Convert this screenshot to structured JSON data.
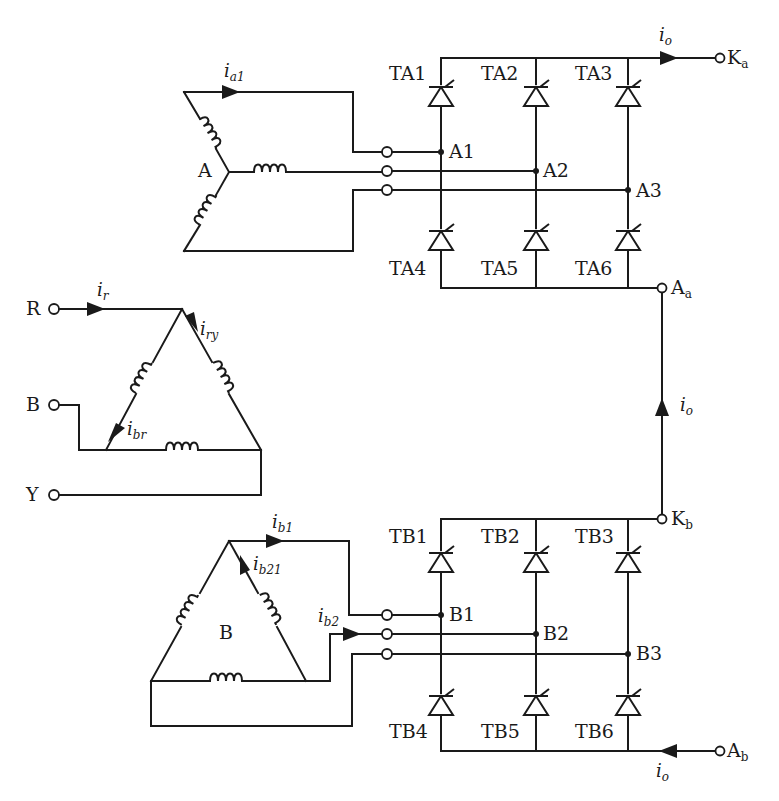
{
  "diagram": {
    "type": "circuit-schematic",
    "primary": {
      "label": "primary-delta",
      "terminals": [
        "R",
        "B",
        "Y"
      ],
      "currents": {
        "line_r": "i",
        "line_r_sub": "r",
        "winding_ry": "i",
        "winding_ry_sub": "ry",
        "winding_br": "i",
        "winding_br_sub": "br"
      }
    },
    "secondary_a": {
      "label": "A",
      "connection": "star",
      "current": "i",
      "current_sub": "a1"
    },
    "secondary_b": {
      "label": "B",
      "connection": "delta",
      "current_b1": "i",
      "current_b1_sub": "b1",
      "current_b21": "i",
      "current_b21_sub": "b21",
      "current_b2": "i",
      "current_b2_sub": "b2"
    },
    "bridge_a": {
      "upper_thyristors": [
        "TA1",
        "TA2",
        "TA3"
      ],
      "lower_thyristors": [
        "TA4",
        "TA5",
        "TA6"
      ],
      "nodes": [
        "A1",
        "A2",
        "A3"
      ],
      "cathode_terminal": "K",
      "cathode_sub": "a",
      "anode_terminal": "A",
      "anode_sub": "a"
    },
    "bridge_b": {
      "upper_thyristors": [
        "TB1",
        "TB2",
        "TB3"
      ],
      "lower_thyristors": [
        "TB4",
        "TB5",
        "TB6"
      ],
      "nodes": [
        "B1",
        "B2",
        "B3"
      ],
      "cathode_terminal": "K",
      "cathode_sub": "b",
      "anode_terminal": "A",
      "anode_sub": "b"
    },
    "output_current": {
      "symbol": "i",
      "sub": "o"
    }
  }
}
